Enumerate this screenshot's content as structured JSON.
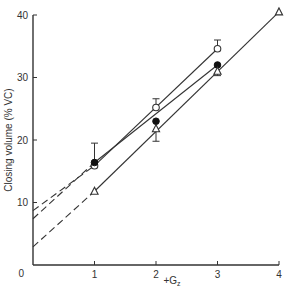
{
  "chart_data": {
    "type": "line",
    "title": "",
    "xlabel": "+Gz",
    "xlabel_main": "+G",
    "xlabel_sub": "z",
    "ylabel": "Closing volume (% VC)",
    "xlim": [
      0,
      4
    ],
    "ylim": [
      0,
      40
    ],
    "x_ticks": [
      0,
      1,
      2,
      3,
      4
    ],
    "y_ticks": [
      0,
      10,
      20,
      30,
      40
    ],
    "grid": false,
    "legend": null,
    "series": [
      {
        "name": "open-circles",
        "marker": "open-circle",
        "x": [
          1,
          2,
          3
        ],
        "values": [
          15.9,
          25.2,
          34.6
        ],
        "error_up": [
          null,
          26.6,
          36.0
        ],
        "error_down": [
          null,
          null,
          null
        ],
        "fit_line": {
          "x0": 1,
          "y0": 15.9,
          "x1": 3,
          "y1": 34.6
        },
        "extrapolation": {
          "x0": 0,
          "y0": 8.7,
          "x1": 1,
          "y1": 15.9
        }
      },
      {
        "name": "filled-circles",
        "marker": "filled-circle",
        "x": [
          1,
          2,
          3
        ],
        "values": [
          16.4,
          23.0,
          32.0
        ],
        "error_up": [
          19.5,
          null,
          null
        ],
        "error_down": [
          null,
          19.8,
          null
        ],
        "fit_line": {
          "x0": 1,
          "y0": 16.4,
          "x1": 3,
          "y1": 32.0
        },
        "extrapolation": {
          "x0": 0,
          "y0": 7.4,
          "x1": 1,
          "y1": 16.4
        }
      },
      {
        "name": "open-triangles",
        "marker": "open-triangle",
        "x": [
          1,
          2,
          3,
          4
        ],
        "values": [
          11.8,
          21.8,
          31.0,
          40.5
        ],
        "error_up": [
          null,
          null,
          null,
          null
        ],
        "error_down": [
          null,
          null,
          30.3,
          null
        ],
        "fit_line": {
          "x0": 1,
          "y0": 11.8,
          "x1": 4,
          "y1": 40.5
        },
        "extrapolation": {
          "x0": 0,
          "y0": 2.9,
          "x1": 1,
          "y1": 11.8
        }
      }
    ]
  },
  "axes": {
    "x_tick_labels": [
      "0",
      "1",
      "2",
      "3",
      "4"
    ],
    "y_tick_labels": [
      "0",
      "10",
      "20",
      "30",
      "40"
    ]
  },
  "colors": {
    "ink": "#333333",
    "background": "#ffffff"
  }
}
